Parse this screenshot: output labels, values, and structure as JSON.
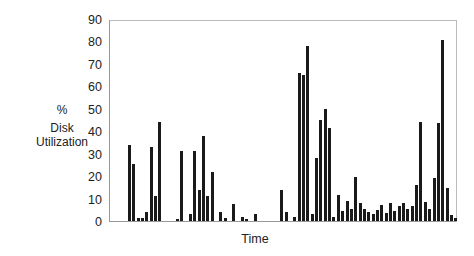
{
  "chart_data": {
    "type": "bar",
    "title": "",
    "xlabel": "Time",
    "ylabel": "% Disk Utilization",
    "ylabel_lines": [
      "%",
      "Disk",
      "Utilization"
    ],
    "ylim": [
      0,
      90
    ],
    "yticks": [
      0,
      10,
      20,
      30,
      40,
      50,
      60,
      70,
      80,
      90
    ],
    "grid": false,
    "legend": null,
    "x": [
      0,
      1,
      2,
      3,
      4,
      5,
      6,
      7,
      8,
      9,
      10,
      11,
      12,
      13,
      14,
      15,
      16,
      17,
      18,
      19,
      20,
      21,
      22,
      23,
      24,
      25,
      26,
      27,
      28,
      29,
      30,
      31,
      32,
      33,
      34,
      35,
      36,
      37,
      38,
      39,
      40,
      41,
      42,
      43,
      44,
      45,
      46,
      47,
      48,
      49,
      50,
      51,
      52,
      53,
      54,
      55,
      56,
      57,
      58,
      59,
      60,
      61,
      62,
      63,
      64,
      65,
      66,
      67,
      68,
      69,
      70,
      71,
      72,
      73,
      74,
      75
    ],
    "values": [
      34,
      25.5,
      1.5,
      1.5,
      4,
      33,
      11,
      44,
      0,
      0,
      0,
      1,
      31,
      0,
      3,
      31,
      14,
      38,
      11,
      22,
      0,
      4,
      1.5,
      0,
      7.5,
      0,
      2,
      1,
      0,
      3,
      0,
      0,
      0,
      0,
      0,
      14,
      4,
      0,
      2,
      66,
      65,
      78,
      3,
      28,
      45,
      50,
      41.5,
      2,
      11.5,
      4.5,
      9,
      5.5,
      19.5,
      8,
      5.5,
      4,
      3,
      5,
      7,
      3.5,
      8,
      4.5,
      6.5,
      8,
      5.5,
      6.5,
      16,
      44,
      8.5,
      5.5,
      19,
      43.5,
      80.5,
      14.5,
      2.5,
      1.5
    ],
    "bar_color": "#1a1a1a"
  }
}
